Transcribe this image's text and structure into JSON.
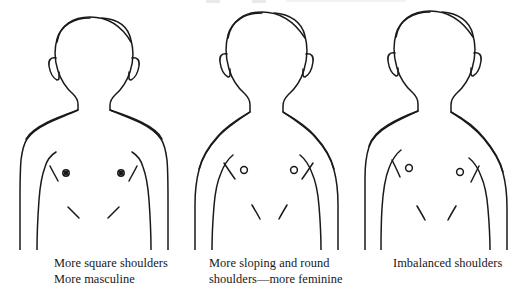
{
  "plate": {
    "title": "Shoulder shape comparison figures",
    "background_color": "#ffffff",
    "ink_color": "#1a1a1a",
    "width": 513,
    "height": 290,
    "top_cutoff_artifact": "faint cut-off text descenders along the very top edge"
  },
  "figures": [
    {
      "id": "figure-square-shoulders",
      "subject": "front-view male torso outline, head, neck, shoulders, arms at sides",
      "shoulder_type": "square",
      "shoulder_slope_degrees": 4,
      "symmetric": true,
      "marks": [
        "left-nipple",
        "right-nipple",
        "left-pectoral-crease",
        "right-pectoral-crease",
        "left-abdominal-crease",
        "right-abdominal-crease",
        "left-ear",
        "right-ear",
        "left-inner-arm-line",
        "right-inner-arm-line"
      ]
    },
    {
      "id": "figure-sloping-shoulders",
      "subject": "front-view male torso outline, head, neck, shoulders, arms at sides",
      "shoulder_type": "sloping-and-round",
      "shoulder_slope_degrees": 24,
      "symmetric": true,
      "marks": [
        "left-nipple",
        "right-nipple",
        "left-pectoral-crease",
        "right-pectoral-crease",
        "left-abdominal-crease",
        "right-abdominal-crease",
        "left-ear",
        "right-ear",
        "left-inner-arm-line",
        "right-inner-arm-line"
      ]
    },
    {
      "id": "figure-imbalanced-shoulders",
      "subject": "front-view male torso outline, head, neck, shoulders, arms at sides",
      "shoulder_type": "imbalanced",
      "shoulder_slope_degrees_left": 8,
      "shoulder_slope_degrees_right": 26,
      "symmetric": false,
      "marks": [
        "left-nipple",
        "right-nipple",
        "left-pectoral-crease",
        "right-pectoral-crease",
        "left-abdominal-crease",
        "right-abdominal-crease",
        "left-ear",
        "right-ear",
        "left-inner-arm-line",
        "right-inner-arm-line"
      ]
    }
  ],
  "captions": [
    {
      "line1": "More square shoulders",
      "line2": "More masculine"
    },
    {
      "line1": "More sloping and round",
      "line2": "shoulders—more feminine"
    },
    {
      "line1": "Imbalanced shoulders",
      "line2": ""
    }
  ]
}
